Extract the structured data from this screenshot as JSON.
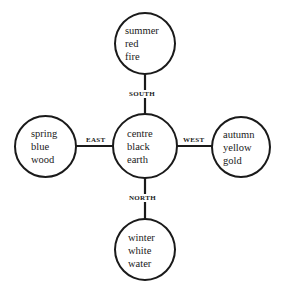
{
  "diagram": {
    "type": "five-element cross",
    "nodes": {
      "top": {
        "lines": [
          "summer",
          "red",
          "fire"
        ]
      },
      "left": {
        "lines": [
          "spring",
          "blue",
          "wood"
        ]
      },
      "center": {
        "lines": [
          "centre",
          "black",
          "earth"
        ]
      },
      "right": {
        "lines": [
          "autumn",
          "yellow",
          "gold"
        ]
      },
      "bottom": {
        "lines": [
          "winter",
          "white",
          "water"
        ]
      }
    },
    "edges": {
      "top": {
        "label": "SOUTH"
      },
      "left": {
        "label": "EAST"
      },
      "right": {
        "label": "WEST"
      },
      "bottom": {
        "label": "NORTH"
      }
    },
    "colors": {
      "stroke": "#1a1a1a",
      "background": "#ffffff"
    }
  }
}
